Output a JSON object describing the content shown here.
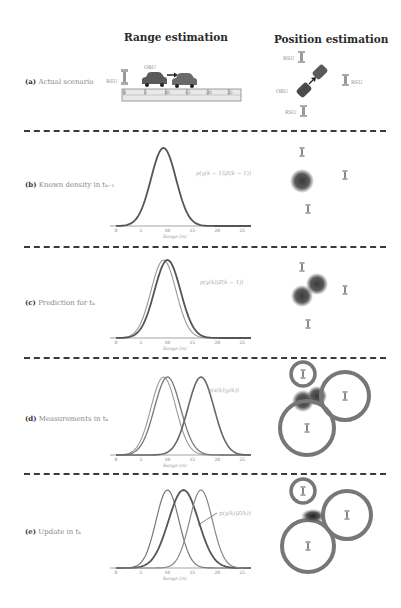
{
  "columns": {
    "range_title": "Range estimation",
    "position_title": "Position estimation"
  },
  "rows": [
    {
      "tag": "(a)",
      "label": "Actual scenario"
    },
    {
      "tag": "(b)",
      "label": "Known density in tₖ₋₁"
    },
    {
      "tag": "(c)",
      "label": "Prediction for tₖ"
    },
    {
      "tag": "(d)",
      "label": "Measurements in tₖ"
    },
    {
      "tag": "(e)",
      "label": "Update in tₖ"
    }
  ],
  "scenario": {
    "rsu_label": "RSU",
    "obu_label": "OBU",
    "ruler_ticks": [
      "0",
      "5",
      "10",
      "15",
      "20",
      "25"
    ]
  },
  "annotations": {
    "b": "p(y(k − 1)|Z(k − 1))",
    "c": "p(y(k)|Z(k − 1))",
    "d": "p(z(k)|y(k))",
    "e": "p(y(k)|Z(k))"
  },
  "axis": {
    "xlabel": "Range (m)",
    "ticks": [
      "0",
      "5",
      "10",
      "15",
      "20",
      "25"
    ]
  },
  "colors": {
    "curve_dark": "#555555",
    "curve_light": "#8a8a8a",
    "separator": "#3a3a3a",
    "blob": "#4a4a4a"
  },
  "chart_data": [
    {
      "type": "line",
      "title": "(b) Known density in t(k-1)",
      "xlabel": "Range (m)",
      "xlim": [
        0,
        27
      ],
      "series": [
        {
          "name": "p(y(k-1)|Z(k-1))",
          "mean": 9.5,
          "std": 2.5
        }
      ]
    },
    {
      "type": "line",
      "title": "(c) Prediction for t(k)",
      "xlabel": "Range (m)",
      "xlim": [
        0,
        27
      ],
      "series": [
        {
          "name": "p(y(k-1)|Z(k-1))",
          "mean": 9.5,
          "std": 2.5
        },
        {
          "name": "p(y(k)|Z(k-1))",
          "mean": 10.3,
          "std": 2.6
        }
      ]
    },
    {
      "type": "line",
      "title": "(d) Measurements in t(k)",
      "xlabel": "Range (m)",
      "xlim": [
        0,
        27
      ],
      "series": [
        {
          "name": "p(y(k-1)|Z(k-1))",
          "mean": 9.5,
          "std": 2.5
        },
        {
          "name": "p(y(k)|Z(k-1))",
          "mean": 10.3,
          "std": 2.6
        },
        {
          "name": "p(z(k)|y(k))",
          "mean": 17.0,
          "std": 2.6
        }
      ]
    },
    {
      "type": "line",
      "title": "(e) Update in t(k)",
      "xlabel": "Range (m)",
      "xlim": [
        0,
        27
      ],
      "series": [
        {
          "name": "p(y(k)|Z(k-1))",
          "mean": 10.3,
          "std": 2.3
        },
        {
          "name": "p(y(k)|Z(k))",
          "mean": 13.5,
          "std": 3.0
        },
        {
          "name": "p(z(k)|y(k))",
          "mean": 17.0,
          "std": 2.3
        }
      ]
    }
  ]
}
